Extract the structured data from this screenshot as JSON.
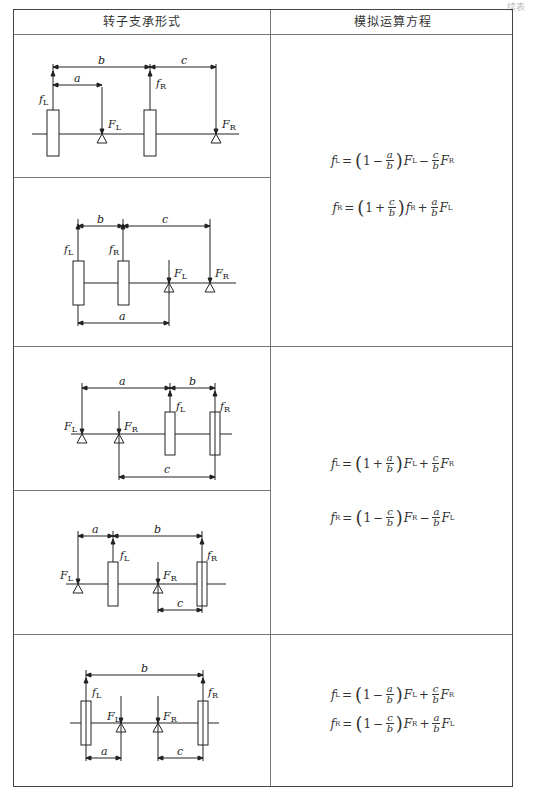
{
  "corner_note": "续表",
  "table": {
    "headers": [
      "转子支承形式",
      "模拟运算方程"
    ],
    "groups": [
      {
        "diagrams": [
          {
            "labels": {
              "f_left": "f",
              "f_left_sub": "L",
              "f_right": "f",
              "f_right_sub": "R",
              "F_left": "F",
              "F_left_sub": "L",
              "F_right": "F",
              "F_right_sub": "R",
              "a": "a",
              "b": "b",
              "c": "c"
            }
          },
          {
            "labels": {
              "f_left": "f",
              "f_left_sub": "L",
              "f_right": "f",
              "f_right_sub": "R",
              "F_left": "F",
              "F_left_sub": "L",
              "F_right": "F",
              "F_right_sub": "R",
              "a": "a",
              "b": "b",
              "c": "c"
            }
          }
        ],
        "equations": [
          {
            "lhs": "f",
            "lhs_sub": "L",
            "one": "1",
            "op1": "−",
            "frac1_num": "a",
            "frac1_den": "b",
            "t1": "F",
            "t1_sub": "L",
            "op2": "−",
            "frac2_num": "c",
            "frac2_den": "b",
            "t2": "F",
            "t2_sub": "R"
          },
          {
            "lhs": "f",
            "lhs_sub": "R",
            "one": "1",
            "op1": "+",
            "frac1_num": "c",
            "frac1_den": "b",
            "t1": "f",
            "t1_sub": "R",
            "op2": "+",
            "frac2_num": "a",
            "frac2_den": "b",
            "t2": "F",
            "t2_sub": "L"
          }
        ]
      },
      {
        "diagrams": [
          {
            "labels": {
              "a": "a",
              "b": "b",
              "c": "c"
            }
          },
          {
            "labels": {
              "a": "a",
              "b": "b",
              "c": "c"
            }
          }
        ],
        "equations": [
          {
            "lhs": "f",
            "lhs_sub": "L",
            "one": "1",
            "op1": "+",
            "frac1_num": "a",
            "frac1_den": "b",
            "t1": "F",
            "t1_sub": "L",
            "op2": "+",
            "frac2_num": "c",
            "frac2_den": "b",
            "t2": "F",
            "t2_sub": "R"
          },
          {
            "lhs": "f",
            "lhs_sub": "R",
            "one": "1",
            "op1": "−",
            "frac1_num": "c",
            "frac1_den": "b",
            "t1": "F",
            "t1_sub": "R",
            "op2": "−",
            "frac2_num": "a",
            "frac2_den": "b",
            "t2": "F",
            "t2_sub": "L"
          }
        ]
      },
      {
        "diagrams": [
          {
            "labels": {
              "a": "a",
              "b": "b",
              "c": "c"
            }
          }
        ],
        "equations": [
          {
            "lhs": "f",
            "lhs_sub": "L",
            "one": "1",
            "op1": "−",
            "frac1_num": "a",
            "frac1_den": "b",
            "t1": "F",
            "t1_sub": "L",
            "op2": "+",
            "frac2_num": "c",
            "frac2_den": "b",
            "t2": "F",
            "t2_sub": "R"
          },
          {
            "lhs": "f",
            "lhs_sub": "R",
            "one": "1",
            "op1": "−",
            "frac1_num": "c",
            "frac1_den": "b",
            "t1": "F",
            "t1_sub": "R",
            "op2": "+",
            "frac2_num": "a",
            "frac2_den": "b",
            "t2": "F",
            "t2_sub": "L"
          }
        ]
      }
    ]
  }
}
